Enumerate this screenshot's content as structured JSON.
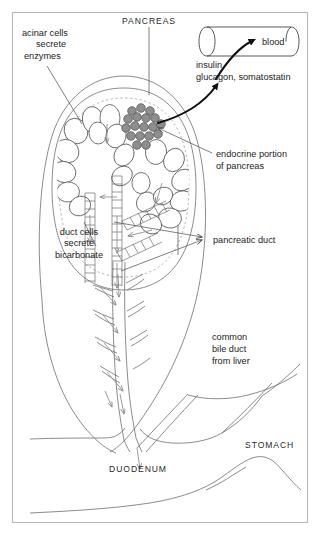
{
  "figure": {
    "background_color": "#ffffff",
    "frame_color": "#b5b5b5"
  },
  "labels": {
    "pancreas": "PANCREAS",
    "acinar_line1": "acinar cells",
    "acinar_line2": "secrete",
    "acinar_line3": "enzymes",
    "blood": "blood",
    "hormones_line1": "insulin",
    "hormones_line2": "glucagon, somatostatin",
    "endocrine_line1": "endocrine portion",
    "endocrine_line2": "of pancreas",
    "duct_cells_line1": "duct cells",
    "duct_cells_line2": "secrete",
    "duct_cells_line3": "bicarbonate",
    "pancreatic_duct": "pancreatic duct",
    "bile_line1": "common",
    "bile_line2": "bile duct",
    "bile_line3": "from liver",
    "stomach": "STOMACH",
    "duodenum": "DUODENUM"
  },
  "colors": {
    "islet_fill": "#8e8e8e",
    "islet_stroke": "#4d4d4d",
    "acinus_fill": "#ffffff",
    "acinus_stroke": "#555555",
    "anatomy_stroke": "#6e6e6e",
    "leader_stroke": "#4a4a4a",
    "flow_arrow": "#8a8a8a",
    "hormone_arrow": "#111111",
    "text": "#1c1c1c"
  },
  "icons": {
    "blood_vessel": "cylinder-icon",
    "islet": "islet-cluster-icon",
    "acini": "acinar-lobule-icon",
    "duct_tree": "branching-duct-icon",
    "flow": "arrow-down-icon"
  }
}
